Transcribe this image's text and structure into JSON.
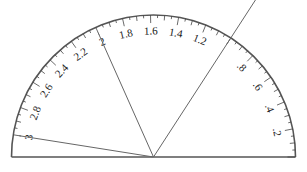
{
  "diagram": {
    "type": "semicircular-scale-gauge",
    "center": {
      "x": 153.5,
      "y": 157
    },
    "radius": 142,
    "degrees_per_unit": 57,
    "scale_min": 0,
    "scale_max": 3,
    "labels": [
      ".2",
      ".4",
      ".6",
      ".8",
      "1",
      "1.2",
      "1.4",
      "1.6",
      "1.8",
      "2",
      "2.2",
      "2.4",
      "2.6",
      "2.8",
      "3"
    ],
    "label_values": [
      0.2,
      0.4,
      0.6,
      0.8,
      1.0,
      1.2,
      1.4,
      1.6,
      1.8,
      2.0,
      2.2,
      2.4,
      2.6,
      2.8,
      3.0
    ],
    "hidden_labels": [
      "1"
    ],
    "minor_tick_step": 0.05,
    "major_tick_step": 0.2,
    "lines": [
      {
        "name": "line-to-3",
        "value": 3.0,
        "extends_beyond_arc": false
      },
      {
        "name": "line-to-2",
        "value": 2.0,
        "extends_beyond_arc": false
      },
      {
        "name": "line-to-1",
        "value": 1.0,
        "extends_beyond_arc": true
      }
    ],
    "colors": {
      "arc": "#555555",
      "ticks": "#444444",
      "lines": "#666666",
      "text": "#222222",
      "background": "#ffffff"
    }
  }
}
